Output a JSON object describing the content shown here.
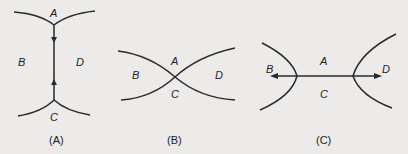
{
  "panels": [
    {
      "caption": "(A)",
      "labels": {
        "top": "A",
        "left": "B",
        "right": "D",
        "bottom": "C"
      },
      "description": "Two curves joined by a vertical segment with arrows pointing toward the center"
    },
    {
      "caption": "(B)",
      "labels": {
        "top": "A",
        "left": "B",
        "right": "D",
        "bottom": "C"
      },
      "description": "Two curves crossing at a single point"
    },
    {
      "caption": "(C)",
      "labels": {
        "top": "A",
        "left": "B",
        "right": "D",
        "bottom": "C"
      },
      "description": "Two curves joined by a horizontal segment with arrows pointing outward"
    }
  ],
  "colors": {
    "background": "#ecebea",
    "ink": "#2a2a2a"
  }
}
